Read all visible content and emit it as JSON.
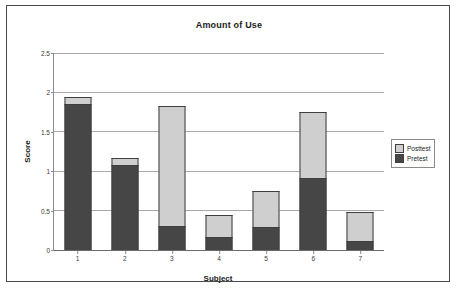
{
  "figure": {
    "title": "Amount of Use"
  },
  "legend": {
    "position": "right",
    "items": [
      {
        "label": "Posttest",
        "color": "#cfcfcf"
      },
      {
        "label": "Pretest",
        "color": "#464646"
      }
    ]
  },
  "axes": {
    "x_title": "Subject",
    "y_title": "Score",
    "y_ticks": [
      "0",
      "0.5",
      "1",
      "1.5",
      "2",
      "2.5"
    ],
    "x_ticks": [
      "1",
      "2",
      "3",
      "4",
      "5",
      "6",
      "7"
    ]
  },
  "chart_data": {
    "type": "bar",
    "subtype": "stacked",
    "title": "Amount of Use",
    "xlabel": "Subject",
    "ylabel": "Score",
    "categories": [
      "1",
      "2",
      "3",
      "4",
      "5",
      "6",
      "7"
    ],
    "series": [
      {
        "name": "Pretest",
        "color": "#464646",
        "values": [
          1.85,
          1.08,
          0.3,
          0.16,
          0.29,
          0.91,
          0.11
        ]
      },
      {
        "name": "Posttest",
        "color": "#cfcfcf",
        "values": [
          0.09,
          0.09,
          1.53,
          0.28,
          0.46,
          0.84,
          0.37
        ]
      }
    ],
    "totals": [
      1.94,
      1.17,
      1.83,
      0.44,
      0.75,
      1.75,
      0.48
    ],
    "ylim": [
      0,
      2.5
    ],
    "ytick_values": [
      0,
      0.5,
      1,
      1.5,
      2,
      2.5
    ],
    "grid": "horizontal",
    "legend_position": "right"
  }
}
